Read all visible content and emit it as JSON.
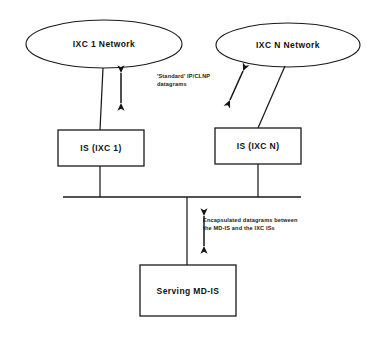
{
  "diagram": {
    "background_color": "#ffffff",
    "stroke_color": "#1a1a1a",
    "nodes": {
      "ixc1_network": {
        "label": "IXC 1 Network",
        "shape": "ellipse",
        "cx": 104,
        "cy": 44,
        "rx": 78,
        "ry": 24
      },
      "ixcn_network": {
        "label": "IXC N Network",
        "shape": "ellipse",
        "cx": 288,
        "cy": 45,
        "rx": 72,
        "ry": 22
      },
      "is_ixc1": {
        "label": "IS (IXC 1)",
        "shape": "rect",
        "x": 58,
        "y": 130,
        "width": 86,
        "height": 36
      },
      "is_ixcn": {
        "label": "IS (IXC N)",
        "shape": "rect",
        "x": 215,
        "y": 128,
        "width": 86,
        "height": 36
      },
      "serving_mdis": {
        "label": "Serving MD-IS",
        "shape": "rect",
        "x": 140,
        "y": 265,
        "width": 96,
        "height": 51
      }
    },
    "bus": {
      "label": "shared-bus",
      "x1": 63,
      "x2": 301,
      "y": 197
    },
    "annotations": [
      {
        "name": "standard-datagrams-annotation",
        "lines": [
          "'Standard' IP/CLNP",
          "datagrams"
        ],
        "x": 157,
        "y": 72
      },
      {
        "name": "encapsulated-datagrams-annotation",
        "lines": [
          "Encapsulated datagrams between",
          "the MD-IS and the IXC ISs"
        ],
        "x": 203,
        "y": 216
      }
    ],
    "arrows": [
      {
        "name": "arrow-ixc1-to-is1",
        "orientation": "vertical",
        "x1": 121,
        "y1": 72,
        "x2": 121,
        "y2": 104
      },
      {
        "name": "arrow-ixcn-to-isn",
        "orientation": "diagonal",
        "x1": 243,
        "y1": 70,
        "x2": 229,
        "y2": 101
      },
      {
        "name": "arrow-bus-to-mdis",
        "orientation": "vertical",
        "x1": 204,
        "y1": 215,
        "x2": 204,
        "y2": 247
      }
    ],
    "links": [
      {
        "name": "link-ixc1-to-is1",
        "x1": 103,
        "y1": 68,
        "x2": 100,
        "y2": 130
      },
      {
        "name": "link-ixcn-to-isn",
        "x1": 285,
        "y1": 66,
        "x2": 258,
        "y2": 128
      },
      {
        "name": "link-is1-to-bus",
        "x1": 100,
        "y1": 166,
        "x2": 100,
        "y2": 197
      },
      {
        "name": "link-isn-to-bus",
        "x1": 258,
        "y1": 164,
        "x2": 258,
        "y2": 197
      },
      {
        "name": "link-bus-to-mdis",
        "x1": 187,
        "y1": 197,
        "x2": 187,
        "y2": 265
      }
    ]
  }
}
